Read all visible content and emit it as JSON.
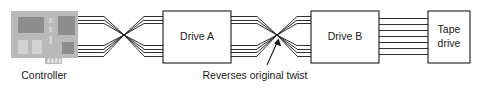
{
  "diagram": {
    "background_color": "#ffffff",
    "line_color": "#1a1a1a",
    "nodes": [
      {
        "id": "controller",
        "type": "pcb-card",
        "label": "Controller",
        "label_position": "below"
      },
      {
        "id": "drive_a",
        "type": "box",
        "label": "Drive A",
        "label_position": "inside"
      },
      {
        "id": "drive_b",
        "type": "box",
        "label": "Drive B",
        "label_position": "inside"
      },
      {
        "id": "tape_drive",
        "type": "box",
        "label_line1": "Tape",
        "label_line2": "drive",
        "label_position": "inside"
      }
    ],
    "cables": [
      {
        "id": "cable-controller-to-drive-a",
        "twisted": true,
        "conductors": 7
      },
      {
        "id": "cable-drive-a-to-drive-b",
        "twisted": true,
        "conductors": 7
      },
      {
        "id": "cable-drive-b-to-tape-drive",
        "twisted": false,
        "conductors": 7
      }
    ],
    "annotation": {
      "text": "Reverses original twist",
      "points_to": "cable-drive-a-to-drive-b"
    },
    "controller_card": {
      "body_color": "#b9b9b9",
      "chip_dark_color": "#8e8e8e",
      "chip_light_color": "#d2d2d2",
      "edge_connector_color": "#e6e6e6"
    }
  }
}
